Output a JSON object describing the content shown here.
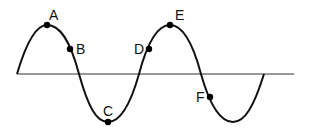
{
  "diagram": {
    "type": "transverse-wave",
    "axis": {
      "x1": 17,
      "x2": 294,
      "y": 74
    },
    "wave_path": "M17,74 C27,40 37,25 47,25 C60,25 70,40 79,74 C88,106 96,122 108,122 C120,122 130,106 139,74 C148,40 158,25 170,25 C182,25 192,40 201,74 C210,106 220,122 233,122 C245,122 254,106 264,74",
    "points": [
      {
        "label": "A",
        "cx": 47,
        "cy": 25,
        "lx": 49,
        "ly": 20
      },
      {
        "label": "B",
        "cx": 70,
        "cy": 49,
        "lx": 76,
        "ly": 54
      },
      {
        "label": "C",
        "cx": 108,
        "cy": 122,
        "lx": 103,
        "ly": 116
      },
      {
        "label": "D",
        "cx": 149,
        "cy": 49,
        "lx": 134,
        "ly": 54
      },
      {
        "label": "E",
        "cx": 170,
        "cy": 25,
        "lx": 175,
        "ly": 20
      },
      {
        "label": "F",
        "cx": 210,
        "cy": 97,
        "lx": 196,
        "ly": 102
      }
    ]
  }
}
